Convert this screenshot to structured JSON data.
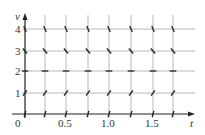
{
  "diagram": {
    "type": "slope-field",
    "x_axis": {
      "label": "t",
      "ticks": [
        "0",
        "0.5",
        "1.0",
        "1.5"
      ]
    },
    "y_axis": {
      "label": "v",
      "ticks": [
        "1",
        "2",
        "3",
        "4"
      ]
    },
    "grid_t": [
      0,
      0.25,
      0.5,
      0.75,
      1.0,
      1.25,
      1.5,
      1.75
    ],
    "grid_v": [
      0,
      1,
      2,
      3,
      4
    ],
    "slope_angles_deg_by_v": {
      "0": 75,
      "1": 55,
      "2": 0,
      "3": -50,
      "4": -68
    },
    "colors": {
      "grid": "#b8b8b8",
      "axis": "#222222",
      "segment": "#222222"
    }
  }
}
